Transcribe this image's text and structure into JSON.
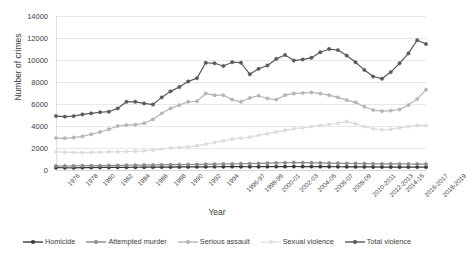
{
  "chart_data": {
    "type": "line",
    "title": "",
    "xlabel": "Year",
    "ylabel": "Number of crimes",
    "ylim": [
      0,
      14000
    ],
    "ytick_labels": [
      "0",
      "2000",
      "4000",
      "6000",
      "8000",
      "10000",
      "12000",
      "14000"
    ],
    "ytick_values": [
      0,
      2000,
      4000,
      6000,
      8000,
      10000,
      12000,
      14000
    ],
    "grid": true,
    "legend_position": "bottom",
    "categories": [
      "1976",
      "1977",
      "1978",
      "1979",
      "1980",
      "1981",
      "1982",
      "1983",
      "1984",
      "1985",
      "1986",
      "1987",
      "1988",
      "1989",
      "1990",
      "1991",
      "1992",
      "1993",
      "1994",
      "1995-96",
      "1996-97",
      "1997-98",
      "1998-99",
      "1999-2000",
      "2000-01",
      "2001-02",
      "2002-03",
      "2003-04",
      "2004-05",
      "2005-06",
      "2006-07",
      "2007-08",
      "2008-09",
      "2009-2010",
      "2010-2011",
      "2011-2012",
      "2012-2013",
      "2013-14",
      "2014-15",
      "2015-2016",
      "2016-2017",
      "2017-2018",
      "2018-2019"
    ],
    "xtick_labels": [
      "1976",
      "1978",
      "1980",
      "1982",
      "1984",
      "1986",
      "1988",
      "1990",
      "1992",
      "1994",
      "1996-97",
      "1998-99",
      "2000-01",
      "2002-03",
      "2004-05",
      "2006-07",
      "2008-09",
      "2010-2011",
      "2012-2013",
      "2014-15",
      "2016-2017",
      "2018-2019"
    ],
    "xtick_indices": [
      0,
      2,
      4,
      6,
      8,
      10,
      12,
      14,
      16,
      18,
      20,
      22,
      24,
      26,
      28,
      30,
      32,
      34,
      36,
      38,
      40,
      42
    ],
    "series": [
      {
        "name": "Homicide",
        "color": "#3a3a3a",
        "values": [
          210,
          205,
          200,
          215,
          225,
          230,
          235,
          240,
          245,
          250,
          255,
          260,
          265,
          270,
          275,
          280,
          285,
          290,
          295,
          300,
          305,
          300,
          295,
          300,
          305,
          310,
          315,
          320,
          315,
          310,
          305,
          300,
          295,
          290,
          285,
          280,
          275,
          270,
          268,
          266,
          264,
          262,
          260
        ]
      },
      {
        "name": "Attempted murder",
        "color": "#8a8a8a",
        "values": [
          360,
          365,
          370,
          380,
          390,
          400,
          410,
          420,
          430,
          440,
          450,
          460,
          470,
          480,
          490,
          500,
          510,
          520,
          530,
          545,
          560,
          570,
          580,
          600,
          620,
          640,
          660,
          680,
          670,
          655,
          640,
          625,
          610,
          600,
          590,
          580,
          570,
          560,
          555,
          550,
          545,
          540,
          535
        ]
      },
      {
        "name": "Serious assault",
        "color": "#b5b5b5",
        "values": [
          2900,
          2880,
          2950,
          3050,
          3250,
          3450,
          3700,
          4000,
          4080,
          4120,
          4250,
          4600,
          5150,
          5600,
          5900,
          6200,
          6250,
          6950,
          6800,
          6800,
          6400,
          6200,
          6550,
          6750,
          6500,
          6400,
          6800,
          6950,
          7000,
          7050,
          6950,
          6800,
          6600,
          6350,
          6150,
          5750,
          5450,
          5350,
          5400,
          5500,
          5900,
          6450,
          7300
        ]
      },
      {
        "name": "Sexual violence",
        "color": "#dcdcdc",
        "values": [
          1650,
          1620,
          1600,
          1580,
          1600,
          1620,
          1640,
          1660,
          1680,
          1700,
          1750,
          1800,
          1900,
          2000,
          2050,
          2100,
          2200,
          2350,
          2500,
          2650,
          2800,
          2900,
          3000,
          3150,
          3300,
          3450,
          3600,
          3750,
          3850,
          3950,
          4050,
          4150,
          4250,
          4400,
          4200,
          3950,
          3750,
          3650,
          3700,
          3850,
          3950,
          4050,
          4050
        ]
      },
      {
        "name": "Total violence",
        "color": "#5a5a5a",
        "values": [
          4900,
          4850,
          4900,
          5050,
          5150,
          5250,
          5300,
          5600,
          6200,
          6200,
          6050,
          5950,
          6600,
          7150,
          7550,
          8050,
          8350,
          9750,
          9700,
          9450,
          9800,
          9750,
          8700,
          9200,
          9500,
          10100,
          10450,
          9950,
          10050,
          10200,
          10700,
          11000,
          10900,
          10400,
          9800,
          9100,
          8500,
          8300,
          8900,
          9700,
          10600,
          11800,
          11450
        ]
      }
    ]
  },
  "legend": {
    "items": [
      {
        "label": "Homicide",
        "color": "#3a3a3a"
      },
      {
        "label": "Attempted murder",
        "color": "#8a8a8a"
      },
      {
        "label": "Serious assault",
        "color": "#b5b5b5"
      },
      {
        "label": "Sexual violence",
        "color": "#e2e2e2"
      },
      {
        "label": "Total violence",
        "color": "#5a5a5a"
      }
    ]
  }
}
